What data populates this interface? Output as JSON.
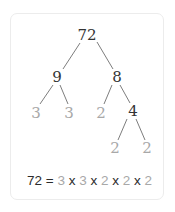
{
  "diagram": {
    "type": "factor-tree",
    "root": "72",
    "level1": [
      "9",
      "8"
    ],
    "level2": [
      "3",
      "3",
      "2",
      "4"
    ],
    "level3": [
      "2",
      "2"
    ],
    "colors": {
      "composite": "#333333",
      "prime": "#a8a8a8",
      "line": "#6e6e6e",
      "card_border": "#ececec"
    }
  },
  "equation": {
    "lhs": "72",
    "eq": " = ",
    "factors": [
      "3",
      "3",
      "2",
      "2",
      "2"
    ],
    "times": " x "
  }
}
